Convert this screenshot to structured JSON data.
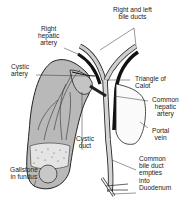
{
  "diagram": {
    "colors": {
      "gallbladder_fill": "#b9b9b9",
      "duct_fill": "#cfcfcf",
      "artery_fill": "#111111",
      "outline": "#222222",
      "background": "#ffffff"
    },
    "labels": {
      "right_left_bile_ducts": "Right and left\nbile ducts",
      "right_hepatic_artery": "Right\nhepatic\nartery",
      "cystic_artery": "Cystic\nartery",
      "triangle_of_calot": "Triangle of\nCalot",
      "common_hepatic_artery": "Common\nhepatic\nartery",
      "portal_vein": "Portal\nvein",
      "cystic_duct": "Cystic\nduct",
      "gallstone_in_fundus": "Gallstone\nin fundus",
      "common_bile_duct": "Common\nbile duct\nempties\ninto\nDuodenum"
    }
  }
}
